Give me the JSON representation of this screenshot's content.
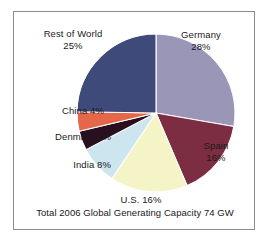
{
  "figure": {
    "background_color": "#ffffff",
    "frame_color": "#8c8c8c"
  },
  "chart_data": {
    "type": "pie",
    "title": "",
    "subtitle": "",
    "xlabel": "",
    "ylabel": "",
    "caption": "Total 2006 Global Generating Capacity  74 GW",
    "total_capacity_value": 74,
    "total_capacity_unit": "GW",
    "year": 2006,
    "legend_position": "none",
    "labels_position": "outside",
    "start_angle_deg": 0,
    "direction": "clockwise",
    "categories": [
      "Germany",
      "Spain",
      "U.S.",
      "India",
      "Denmark",
      "China",
      "Rest of World"
    ],
    "values": [
      28,
      16,
      16,
      8,
      4,
      4,
      25
    ],
    "value_unit": "%",
    "colors": [
      "#9a96b8",
      "#7d2d42",
      "#f4f4c6",
      "#cce5ee",
      "#2a0f20",
      "#e4674a",
      "#3d4a7a"
    ],
    "slices": [
      {
        "name": "Germany",
        "value": 28,
        "label_name": "Germany",
        "label_pct": "28%",
        "color": "#9a96b8"
      },
      {
        "name": "Spain",
        "value": 16,
        "label_name": "Spain",
        "label_pct": "16%",
        "color": "#7d2d42"
      },
      {
        "name": "U.S.",
        "value": 16,
        "label_name": "U.S.",
        "label_pct": "16%",
        "color": "#f4f4c6"
      },
      {
        "name": "India",
        "value": 8,
        "label_name": "India",
        "label_pct": "8%",
        "color": "#cce5ee"
      },
      {
        "name": "Denmark",
        "value": 4,
        "label_name": "Denmark",
        "label_pct": "4%",
        "color": "#2a0f20"
      },
      {
        "name": "China",
        "value": 4,
        "label_name": "China",
        "label_pct": "4%",
        "color": "#e4674a"
      },
      {
        "name": "Rest of World",
        "value": 25,
        "label_name": "Rest of World",
        "label_pct": "25%",
        "color": "#3d4a7a"
      }
    ]
  }
}
